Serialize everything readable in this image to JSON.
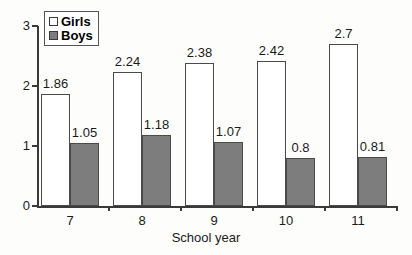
{
  "chart_data": {
    "type": "bar",
    "title": "",
    "xlabel": "School year",
    "ylabel": "",
    "categories": [
      "7",
      "8",
      "9",
      "10",
      "11"
    ],
    "ylim": [
      0,
      3
    ],
    "yticks": [
      "0",
      "1",
      "2",
      "3"
    ],
    "grid": false,
    "legend_position": "top-left-inside",
    "series": [
      {
        "name": "Girls",
        "values": [
          1.86,
          2.24,
          2.38,
          2.42,
          2.7
        ],
        "labels": [
          "1.86",
          "2.24",
          "2.38",
          "2.42",
          "2.7"
        ],
        "color": "#ffffff"
      },
      {
        "name": "Boys",
        "values": [
          1.05,
          1.18,
          1.07,
          0.8,
          0.81
        ],
        "labels": [
          "1.05",
          "1.18",
          "1.07",
          "0.8",
          "0.81"
        ],
        "color": "#7d7d7d"
      }
    ]
  },
  "legend": {
    "items": [
      {
        "label": "Girls",
        "swatch": "white-square"
      },
      {
        "label": "Boys",
        "swatch": "gray-square"
      }
    ]
  }
}
